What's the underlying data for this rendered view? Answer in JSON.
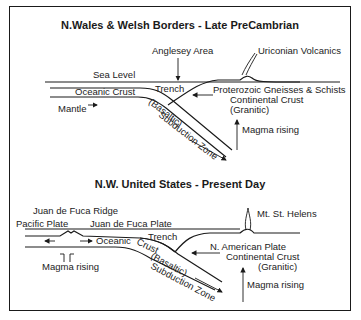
{
  "panels": [
    {
      "title": "N.Wales & Welsh Borders - Late PreCambrian",
      "labels": {
        "anglesey": "Anglesey Area",
        "volcanics": "Uriconian Volcanics",
        "sea_level": "Sea Level",
        "trench": "Trench",
        "oceanic_crust": "Oceanic Crust",
        "basaltic": "(Basaltic)",
        "subduction": "Subduction Zone",
        "mantle": "Mantle",
        "gneisses": "Proterozoic Gneisses & Schists",
        "continental": "Continental Crust",
        "granitic": "(Granitic)",
        "magma": "Magma rising"
      }
    },
    {
      "title": "N.W. United States - Present Day",
      "labels": {
        "ridge": "Juan de Fuca Ridge",
        "pacific": "Pacific Plate",
        "jdf_plate": "Juan de Fuca Plate",
        "trench": "Trench",
        "oceanic": "Oceanic",
        "crust": "Crust",
        "basaltic": "(Basaltic)",
        "subduction": "Subduction Zone",
        "magma_ridge": "Magma rising",
        "volcano": "Mt. St. Helens",
        "na_plate": "N. American Plate",
        "continental": "Continental Crust",
        "granitic": "(Granitic)",
        "magma": "Magma rising"
      }
    }
  ]
}
